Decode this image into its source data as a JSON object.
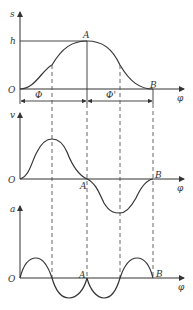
{
  "diagram": {
    "panels": [
      {
        "name": "displacement",
        "y_axis_label": "s",
        "x_axis_label": "φ",
        "origin_label": "O",
        "level_label": "h",
        "point_labels": [
          "A",
          "B"
        ],
        "interval_labels": [
          "Φ",
          "Φ'"
        ]
      },
      {
        "name": "velocity",
        "y_axis_label": "v",
        "x_axis_label": "φ",
        "origin_label": "O",
        "point_labels": [
          "A",
          "B"
        ]
      },
      {
        "name": "acceleration",
        "y_axis_label": "a",
        "x_axis_label": "φ",
        "origin_label": "O",
        "point_labels": [
          "A",
          "B"
        ]
      }
    ]
  },
  "labels": {
    "s": "s",
    "h": "h",
    "O1": "O",
    "A1": "A",
    "B1": "B",
    "phi1": "φ",
    "Phi": "Φ",
    "PhiPrime": "Φ'",
    "v": "v",
    "O2": "O",
    "A2": "A",
    "B2": "B",
    "phi2": "φ",
    "a": "a",
    "O3": "O",
    "A3": "A",
    "B3": "B",
    "phi3": "φ"
  }
}
